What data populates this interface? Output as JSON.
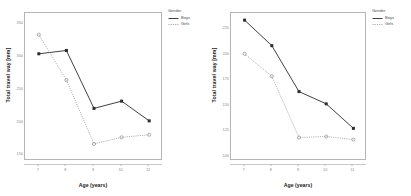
{
  "legend": {
    "title": "Gender",
    "entries": [
      {
        "label": "Boys",
        "style": "solid",
        "color": "#2b2b2b"
      },
      {
        "label": "Girls",
        "style": "dotted",
        "color": "#9a9a9a"
      }
    ]
  },
  "chart_data": [
    {
      "type": "line",
      "id": "left-chart",
      "title": "",
      "xlabel": "Age (years)",
      "ylabel": "Total travel way [mm]",
      "x": [
        7,
        8,
        9,
        10,
        11
      ],
      "categories": [
        "7",
        "8",
        "9",
        "10",
        "11"
      ],
      "xticklabels": [
        "7",
        "8",
        "9",
        "10",
        "11"
      ],
      "yticklabels": [
        "350",
        "300",
        "250",
        "200",
        "150"
      ],
      "ytickvalues": [
        350,
        300,
        250,
        200,
        150
      ],
      "xlim": [
        6.5,
        11.5
      ],
      "ylim": [
        140,
        365
      ],
      "grid": false,
      "legend_position": "right",
      "series": [
        {
          "name": "Boys",
          "style": "solid",
          "color": "#2b2b2b",
          "marker": "square",
          "values": [
            303,
            308,
            220,
            231,
            201
          ]
        },
        {
          "name": "Girls",
          "style": "dotted",
          "color": "#9a9a9a",
          "marker": "circle",
          "values": [
            332,
            263,
            166,
            176,
            180
          ]
        }
      ]
    },
    {
      "type": "line",
      "id": "right-chart",
      "title": "",
      "xlabel": "Age (years)",
      "ylabel": "Total travel way [mm]",
      "x": [
        7,
        8,
        9,
        10,
        11
      ],
      "categories": [
        "7",
        "8",
        "9",
        "10",
        "11"
      ],
      "xticklabels": [
        "7",
        "8",
        "9",
        "10",
        "11"
      ],
      "yticklabels": [
        "225",
        "200",
        "175",
        "150",
        "125",
        "100"
      ],
      "ytickvalues": [
        225,
        200,
        175,
        150,
        125,
        100
      ],
      "xlim": [
        6.5,
        11.5
      ],
      "ylim": [
        95,
        240
      ],
      "grid": false,
      "legend_position": "right",
      "series": [
        {
          "name": "Boys",
          "style": "solid",
          "color": "#2b2b2b",
          "marker": "square",
          "values": [
            233,
            208,
            163,
            151,
            127
          ]
        },
        {
          "name": "Girls",
          "style": "dotted",
          "color": "#9a9a9a",
          "marker": "circle",
          "values": [
            200,
            178,
            118,
            119,
            116
          ]
        }
      ]
    }
  ]
}
